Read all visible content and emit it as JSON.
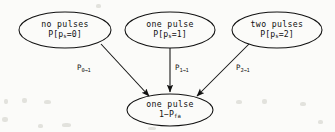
{
  "diagram": {
    "type": "state-transition-graph",
    "background_color": "#fbfbf9",
    "stroke_color": "#111111",
    "nodes": [
      {
        "id": "no-pulses",
        "line1": "no pulses",
        "line2_prefix": "P[p",
        "line2_sub": "s",
        "line2_suffix": "=0]",
        "cx": 65,
        "cy": 30,
        "rx": 46,
        "ry": 18
      },
      {
        "id": "one-pulse-in",
        "line1": "one pulse",
        "line2_prefix": "P[p",
        "line2_sub": "s",
        "line2_suffix": "=1]",
        "cx": 170,
        "cy": 30,
        "rx": 45,
        "ry": 18
      },
      {
        "id": "two-pulses",
        "line1": "two pulses",
        "line2_prefix": "P[p",
        "line2_sub": "s",
        "line2_suffix": "=2]",
        "cx": 277,
        "cy": 30,
        "rx": 45,
        "ry": 18
      },
      {
        "id": "one-pulse-out",
        "line1": "one pulse",
        "line2_prefix": "1−P",
        "line2_sub": "fa",
        "line2_suffix": "",
        "cx": 170,
        "cy": 110,
        "rx": 43,
        "ry": 16
      }
    ],
    "edges": [
      {
        "id": "edge-0-to-1",
        "from": "no-pulses",
        "to": "one-pulse-out",
        "label_prefix": "P",
        "label_sub": "0→1",
        "label_x": 77,
        "label_y": 63
      },
      {
        "id": "edge-1-to-1",
        "from": "one-pulse-in",
        "to": "one-pulse-out",
        "label_prefix": "P",
        "label_sub": "1→1",
        "label_x": 175,
        "label_y": 63
      },
      {
        "id": "edge-2-to-1",
        "from": "two-pulses",
        "to": "one-pulse-out",
        "label_prefix": "P",
        "label_sub": "2→1",
        "label_x": 236,
        "label_y": 63
      }
    ]
  }
}
